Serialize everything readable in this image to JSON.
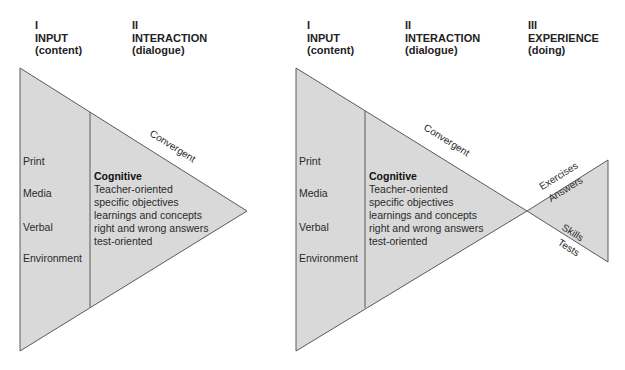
{
  "colors": {
    "fill": "#d9d9d9",
    "stroke": "#5a5a5a",
    "text": "#2a2a2a"
  },
  "left_diagram": {
    "headers": [
      {
        "numeral": "I",
        "title": "INPUT",
        "subtitle": "(content)"
      },
      {
        "numeral": "II",
        "title": "INTERACTION",
        "subtitle": "(dialogue)"
      }
    ],
    "input_items": [
      "Print",
      "Media",
      "Verbal",
      "Environment"
    ],
    "edge_label": "Convergent",
    "interaction": {
      "title": "Cognitive",
      "lines": [
        "Teacher-oriented",
        "specific objectives",
        "learnings and concepts",
        "right and wrong answers",
        "test-oriented"
      ]
    }
  },
  "right_diagram": {
    "headers": [
      {
        "numeral": "I",
        "title": "INPUT",
        "subtitle": "(content)"
      },
      {
        "numeral": "II",
        "title": "INTERACTION",
        "subtitle": "(dialogue)"
      },
      {
        "numeral": "III",
        "title": "EXPERIENCE",
        "subtitle": "(doing)"
      }
    ],
    "input_items": [
      "Print",
      "Media",
      "Verbal",
      "Environment"
    ],
    "edge_label": "Convergent",
    "interaction": {
      "title": "Cognitive",
      "lines": [
        "Teacher-oriented",
        "specific objectives",
        "learnings and concepts",
        "right and wrong answers",
        "test-oriented"
      ]
    },
    "experience": {
      "upper_outer": "Exercises",
      "upper_inner": "Answers",
      "lower_inner": "Skills",
      "lower_outer": "Tests"
    }
  }
}
